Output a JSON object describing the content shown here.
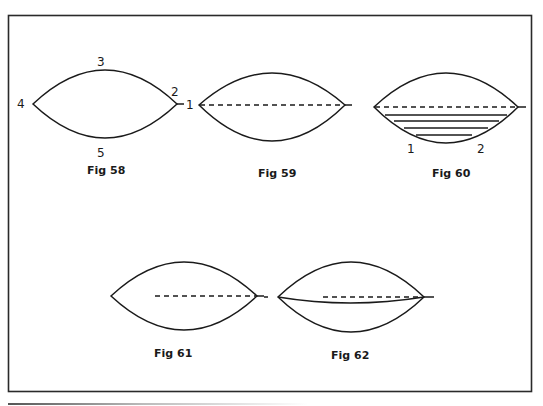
{
  "figures": {
    "fig58": {
      "caption": "Fig 58",
      "labels": {
        "p1": "1",
        "p2": "2",
        "p3": "3",
        "p4": "4",
        "p5": "5"
      }
    },
    "fig59": {
      "caption": "Fig 59"
    },
    "fig60": {
      "caption": "Fig 60",
      "labels": {
        "p1": "1",
        "p2": "2"
      }
    },
    "fig61": {
      "caption": "Fig 61"
    },
    "fig62": {
      "caption": "Fig 62"
    }
  },
  "colors": {
    "ink": "#1a1a1a",
    "frame": "#2a2a2a",
    "background": "#ffffff"
  }
}
